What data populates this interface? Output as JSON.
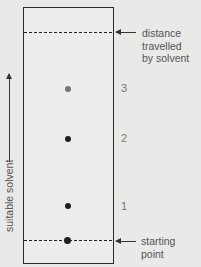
{
  "diagram": {
    "labels": {
      "solvent_front": [
        "distance",
        "travelled",
        "by solvent"
      ],
      "start": "starting point",
      "direction": "suitable solvent"
    },
    "spots": [
      {
        "id": "1",
        "label": "1",
        "color": "#1e1e1e"
      },
      {
        "id": "2",
        "label": "2",
        "color": "#1e1e1e"
      },
      {
        "id": "3",
        "label": "3",
        "color": "#777777"
      }
    ]
  }
}
